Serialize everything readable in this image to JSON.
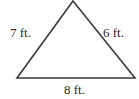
{
  "figure": {
    "shape": "triangle",
    "stroke_color": "#3a3a3a",
    "vertices": {
      "top": [
        73,
        1
      ],
      "bottom_left": [
        17,
        78
      ],
      "bottom_right": [
        135,
        78
      ]
    },
    "sides": {
      "left": {
        "label": "7 ft.",
        "length": 7,
        "unit": "ft."
      },
      "right": {
        "label": "6 ft.",
        "length": 6,
        "unit": "ft."
      },
      "bottom": {
        "label": "8 ft.",
        "length": 8,
        "unit": "ft."
      }
    }
  }
}
